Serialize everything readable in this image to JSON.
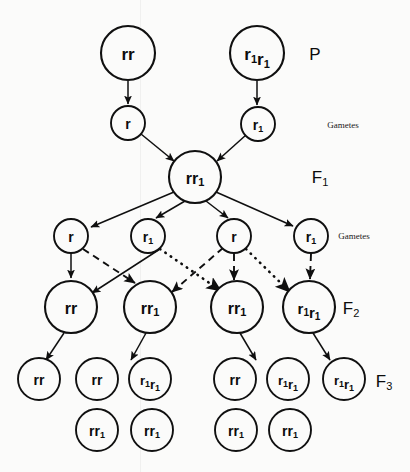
{
  "colors": {
    "background": "#fbfbfa",
    "stroke": "#0f0f0f",
    "text": "#0c0c0c"
  },
  "generation_labels": [
    {
      "id": "P",
      "text": "P",
      "sub": "",
      "x": 315,
      "y": 54,
      "size": 17
    },
    {
      "id": "F1",
      "text": "F",
      "sub": "1",
      "x": 320,
      "y": 177,
      "size": 17
    },
    {
      "id": "F2",
      "text": "F",
      "sub": "2",
      "x": 351,
      "y": 308,
      "size": 17
    },
    {
      "id": "F3",
      "text": "F",
      "sub": "3",
      "x": 384,
      "y": 381,
      "size": 17
    }
  ],
  "gamete_labels": [
    {
      "id": "gametes-p",
      "text": "Gametes",
      "x": 343,
      "y": 125
    },
    {
      "id": "gametes-f1",
      "text": "Gametes",
      "x": 354,
      "y": 236
    }
  ],
  "rows": [
    {
      "id": "parental-row",
      "name": "P generation individuals",
      "nodes": [
        {
          "id": "p-1",
          "genotype": "rr",
          "allele1": "r",
          "sub1": "",
          "allele2": "r",
          "sub2": "",
          "cx": 128,
          "cy": 53,
          "r": 27,
          "font": 17
        },
        {
          "id": "p-2",
          "genotype": "r1r1",
          "allele1": "r",
          "sub1": "1",
          "allele2": "r",
          "sub2": "1",
          "cx": 257,
          "cy": 53,
          "r": 27,
          "font": 17
        }
      ]
    },
    {
      "id": "p-gametes-row",
      "name": "P gametes",
      "nodes": [
        {
          "id": "pg-1",
          "genotype": "r",
          "allele1": "r",
          "sub1": "",
          "allele2": "",
          "sub2": "",
          "cx": 128,
          "cy": 123,
          "r": 17,
          "font": 14
        },
        {
          "id": "pg-2",
          "genotype": "r1",
          "allele1": "r",
          "sub1": "1",
          "allele2": "",
          "sub2": "",
          "cx": 258,
          "cy": 124,
          "r": 17,
          "font": 14
        }
      ]
    },
    {
      "id": "f1-row",
      "name": "F1 generation individual",
      "nodes": [
        {
          "id": "f1-1",
          "genotype": "rr1",
          "allele1": "r",
          "sub1": "",
          "allele2": "r",
          "sub2": "1",
          "cx": 195,
          "cy": 177,
          "r": 26,
          "font": 16
        }
      ]
    },
    {
      "id": "f1-gametes-row",
      "name": "F1 gametes",
      "nodes": [
        {
          "id": "fg-1",
          "genotype": "r",
          "allele1": "r",
          "sub1": "",
          "allele2": "",
          "sub2": "",
          "cx": 71,
          "cy": 236,
          "r": 17,
          "font": 14
        },
        {
          "id": "fg-2",
          "genotype": "r1",
          "allele1": "r",
          "sub1": "1",
          "allele2": "",
          "sub2": "",
          "cx": 148,
          "cy": 236,
          "r": 17,
          "font": 14
        },
        {
          "id": "fg-3",
          "genotype": "r",
          "allele1": "r",
          "sub1": "",
          "allele2": "",
          "sub2": "",
          "cx": 234,
          "cy": 236,
          "r": 17,
          "font": 14
        },
        {
          "id": "fg-4",
          "genotype": "r1",
          "allele1": "r",
          "sub1": "1",
          "allele2": "",
          "sub2": "",
          "cx": 311,
          "cy": 236,
          "r": 17,
          "font": 14
        }
      ]
    },
    {
      "id": "f2-row",
      "name": "F2 generation individuals",
      "nodes": [
        {
          "id": "f2-1",
          "genotype": "rr",
          "allele1": "r",
          "sub1": "",
          "allele2": "r",
          "sub2": "",
          "cx": 71,
          "cy": 307,
          "r": 26,
          "font": 16
        },
        {
          "id": "f2-2",
          "genotype": "rr1",
          "allele1": "r",
          "sub1": "",
          "allele2": "r",
          "sub2": "1",
          "cx": 150,
          "cy": 307,
          "r": 26,
          "font": 16
        },
        {
          "id": "f2-3",
          "genotype": "rr1",
          "allele1": "r",
          "sub1": "",
          "allele2": "r",
          "sub2": "1",
          "cx": 237,
          "cy": 307,
          "r": 26,
          "font": 16
        },
        {
          "id": "f2-4",
          "genotype": "r1r1",
          "allele1": "r",
          "sub1": "1",
          "allele2": "r",
          "sub2": "1",
          "cx": 309,
          "cy": 307,
          "r": 26,
          "font": 15
        }
      ]
    },
    {
      "id": "f3-row-upper",
      "name": "F3 generation individuals, upper row",
      "nodes": [
        {
          "id": "f3-1",
          "genotype": "rr",
          "allele1": "r",
          "sub1": "",
          "allele2": "r",
          "sub2": "",
          "cx": 39,
          "cy": 379,
          "r": 21,
          "font": 14
        },
        {
          "id": "f3-2",
          "genotype": "rr",
          "allele1": "r",
          "sub1": "",
          "allele2": "r",
          "sub2": "",
          "cx": 97,
          "cy": 379,
          "r": 21,
          "font": 14
        },
        {
          "id": "f3-3",
          "genotype": "r1r1",
          "allele1": "r",
          "sub1": "1",
          "allele2": "r",
          "sub2": "1",
          "cx": 150,
          "cy": 379,
          "r": 21,
          "font": 13
        },
        {
          "id": "f3-4",
          "genotype": "rr",
          "allele1": "r",
          "sub1": "",
          "allele2": "r",
          "sub2": "",
          "cx": 235,
          "cy": 379,
          "r": 21,
          "font": 14
        },
        {
          "id": "f3-5",
          "genotype": "r1r1",
          "allele1": "r",
          "sub1": "1",
          "allele2": "r",
          "sub2": "1",
          "cx": 288,
          "cy": 379,
          "r": 21,
          "font": 13
        },
        {
          "id": "f3-6",
          "genotype": "r1r1",
          "allele1": "r",
          "sub1": "1",
          "allele2": "r",
          "sub2": "1",
          "cx": 344,
          "cy": 379,
          "r": 21,
          "font": 13
        }
      ]
    },
    {
      "id": "f3-row-lower",
      "name": "F3 generation individuals, lower row",
      "nodes": [
        {
          "id": "f3-7",
          "genotype": "rr1",
          "allele1": "r",
          "sub1": "",
          "allele2": "r",
          "sub2": "1",
          "cx": 97,
          "cy": 430,
          "r": 21,
          "font": 14
        },
        {
          "id": "f3-8",
          "genotype": "rr1",
          "allele1": "r",
          "sub1": "",
          "allele2": "r",
          "sub2": "1",
          "cx": 152,
          "cy": 430,
          "r": 21,
          "font": 14
        },
        {
          "id": "f3-9",
          "genotype": "rr1",
          "allele1": "r",
          "sub1": "",
          "allele2": "r",
          "sub2": "1",
          "cx": 236,
          "cy": 430,
          "r": 21,
          "font": 14
        },
        {
          "id": "f3-10",
          "genotype": "rr1",
          "allele1": "r",
          "sub1": "",
          "allele2": "r",
          "sub2": "1",
          "cx": 290,
          "cy": 430,
          "r": 21,
          "font": 14
        }
      ]
    }
  ],
  "edges": [
    {
      "id": "e-p1-pg1",
      "style": "solid",
      "x1": 128,
      "y1": 81,
      "x2": 128,
      "y2": 104
    },
    {
      "id": "e-p2-pg2",
      "style": "solid",
      "x1": 257,
      "y1": 81,
      "x2": 257,
      "y2": 105
    },
    {
      "id": "e-pg1-f1",
      "style": "solid",
      "x1": 141,
      "y1": 134,
      "x2": 174,
      "y2": 161
    },
    {
      "id": "e-pg2-f1",
      "style": "solid",
      "x1": 246,
      "y1": 135,
      "x2": 217,
      "y2": 161
    },
    {
      "id": "e-f1-fg1",
      "style": "solid",
      "x1": 174,
      "y1": 192,
      "x2": 91,
      "y2": 227
    },
    {
      "id": "e-f1-fg2",
      "style": "solid",
      "x1": 185,
      "y1": 201,
      "x2": 156,
      "y2": 218
    },
    {
      "id": "e-f1-fg3",
      "style": "solid",
      "x1": 206,
      "y1": 201,
      "x2": 228,
      "y2": 218
    },
    {
      "id": "e-f1-fg4",
      "style": "solid",
      "x1": 216,
      "y1": 192,
      "x2": 293,
      "y2": 226
    },
    {
      "id": "e-fg1-f2-1",
      "style": "solid",
      "x1": 71,
      "y1": 254,
      "x2": 71,
      "y2": 278
    },
    {
      "id": "e-fg1-f2-2",
      "style": "dashed",
      "x1": 83,
      "y1": 249,
      "x2": 135,
      "y2": 283
    },
    {
      "id": "e-fg2-f2-1",
      "style": "solid",
      "x1": 160,
      "y1": 249,
      "x2": 92,
      "y2": 293
    },
    {
      "id": "e-fg2-f2-3",
      "style": "dotted",
      "x1": 160,
      "y1": 249,
      "x2": 221,
      "y2": 291
    },
    {
      "id": "e-fg3-f2-2",
      "style": "dashed",
      "x1": 223,
      "y1": 248,
      "x2": 172,
      "y2": 292
    },
    {
      "id": "e-fg3-f2-3",
      "style": "dashed",
      "x1": 234,
      "y1": 254,
      "x2": 234,
      "y2": 280
    },
    {
      "id": "e-fg3-f2-4",
      "style": "dotted",
      "x1": 246,
      "y1": 249,
      "x2": 290,
      "y2": 292
    },
    {
      "id": "e-fg4-f2-4",
      "style": "dashed",
      "x1": 311,
      "y1": 254,
      "x2": 310,
      "y2": 279
    },
    {
      "id": "e-f2-1-f3-1",
      "style": "solid",
      "x1": 64,
      "y1": 333,
      "x2": 46,
      "y2": 360
    },
    {
      "id": "e-f2-2-f3-3",
      "style": "solid",
      "x1": 146,
      "y1": 333,
      "x2": 131,
      "y2": 360
    },
    {
      "id": "e-f2-3-f3-4",
      "style": "solid",
      "x1": 240,
      "y1": 333,
      "x2": 256,
      "y2": 360
    },
    {
      "id": "e-f2-4-f3-6",
      "style": "solid",
      "x1": 313,
      "y1": 333,
      "x2": 330,
      "y2": 360
    }
  ]
}
